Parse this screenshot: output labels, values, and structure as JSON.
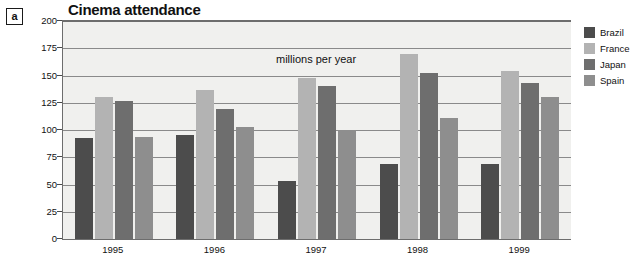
{
  "figure": {
    "label": "a"
  },
  "annotation": {
    "text": "millions per year"
  },
  "legend": {
    "position": "right",
    "items": [
      {
        "label": "Brazil",
        "color": "#4c4c4c"
      },
      {
        "label": "France",
        "color": "#b3b3b3"
      },
      {
        "label": "Japan",
        "color": "#6e6e6e"
      },
      {
        "label": "Spain",
        "color": "#8e8e8e"
      }
    ]
  },
  "chart_data": {
    "type": "bar",
    "title": "Cinema attendance",
    "xlabel": "",
    "ylabel": "",
    "ylim": [
      0,
      200
    ],
    "yticks": [
      0,
      25,
      50,
      75,
      100,
      125,
      150,
      175,
      200
    ],
    "ytick_labels": [
      "0",
      "25",
      "50",
      "75",
      "100",
      "125",
      "150",
      "175",
      "200"
    ],
    "grid": true,
    "units": "millions per year",
    "categories": [
      "1995",
      "1996",
      "1997",
      "1998",
      "1999"
    ],
    "series": [
      {
        "name": "Brazil",
        "color": "#4c4c4c",
        "values": [
          93,
          95,
          53,
          69,
          69
        ]
      },
      {
        "name": "France",
        "color": "#b3b3b3",
        "values": [
          130,
          137,
          148,
          170,
          154
        ]
      },
      {
        "name": "Japan",
        "color": "#6e6e6e",
        "values": [
          127,
          119,
          140,
          152,
          143
        ]
      },
      {
        "name": "Spain",
        "color": "#8e8e8e",
        "values": [
          94,
          103,
          100,
          111,
          130
        ]
      }
    ]
  }
}
